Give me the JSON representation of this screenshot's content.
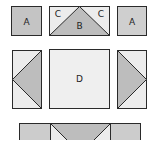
{
  "diagram": {
    "colors": {
      "dark": "#bdbdbd",
      "light": "#ececec",
      "stroke": "#2a2a2a"
    },
    "labels": {
      "a_left": "A",
      "b": "B",
      "c_left": "C",
      "c_right": "C",
      "a_right": "A",
      "d": "D"
    },
    "rows": [
      {
        "name": "top-row",
        "pieces": [
          "A",
          "C-B-C",
          "A"
        ]
      },
      {
        "name": "middle-row",
        "pieces": [
          "side-left",
          "D",
          "side-right"
        ]
      },
      {
        "name": "bottom-row",
        "pieces": [
          "A",
          "flying-geese",
          "A"
        ]
      }
    ]
  }
}
